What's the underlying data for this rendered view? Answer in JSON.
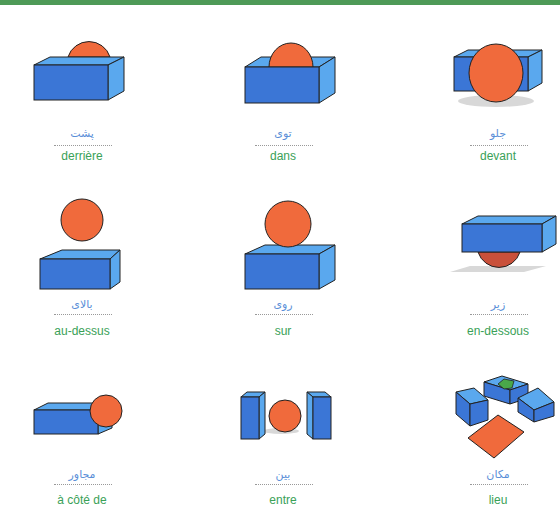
{
  "header": {
    "bar_color": "#4e9a57"
  },
  "colors": {
    "box": "#3b76d6",
    "box_light": "#5aa8ee",
    "ball": "#f06a3c",
    "arabic_text": "#5b8fd8",
    "french_text": "#3aa157"
  },
  "items": [
    {
      "arabic": "پشت",
      "french": "derrière",
      "icon": "box-ball-behind-icon"
    },
    {
      "arabic": "توی",
      "french": "dans",
      "icon": "box-ball-inside-icon"
    },
    {
      "arabic": "جلو",
      "french": "devant",
      "icon": "ball-in-front-of-box-icon"
    },
    {
      "arabic": "بالای",
      "french": "au-dessus",
      "icon": "ball-above-box-icon"
    },
    {
      "arabic": "روی",
      "french": "sur",
      "icon": "ball-on-box-icon"
    },
    {
      "arabic": "زیر",
      "french": "en-dessous",
      "icon": "ball-under-box-icon"
    },
    {
      "arabic": "مجاور",
      "french": "à côté de",
      "icon": "ball-beside-box-icon"
    },
    {
      "arabic": "بین",
      "french": "entre",
      "icon": "ball-between-boxes-icon"
    },
    {
      "arabic": "مکان",
      "french": "lieu",
      "icon": "place-icon"
    }
  ]
}
